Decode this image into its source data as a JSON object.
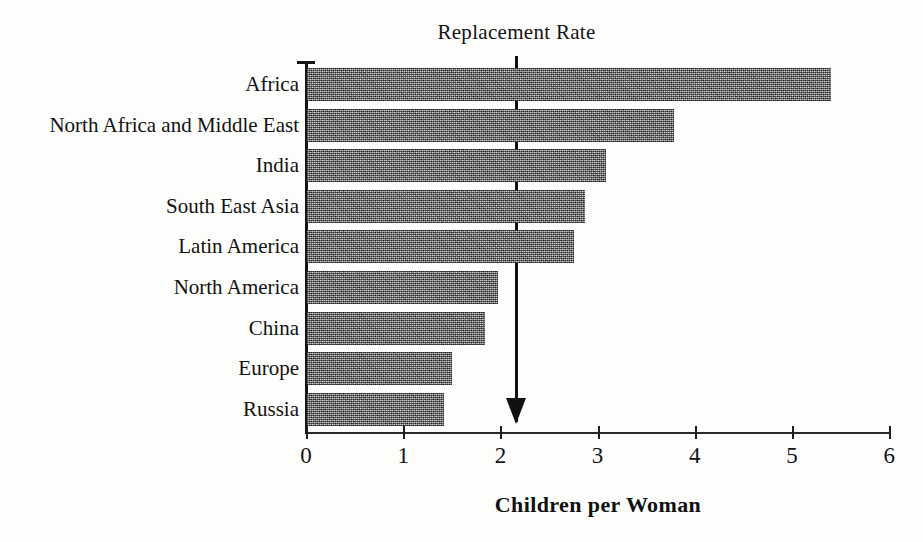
{
  "chart_data": {
    "type": "bar",
    "orientation": "horizontal",
    "title": "",
    "xlabel": "Children per Woman",
    "ylabel": "",
    "xlim": [
      0,
      6
    ],
    "xticks": [
      0,
      1,
      2,
      3,
      4,
      5,
      6
    ],
    "xtick_labels": [
      "0",
      "1",
      "2",
      "3",
      "4",
      "5",
      "6"
    ],
    "grid": false,
    "legend": null,
    "categories": [
      "Africa",
      "North Africa and Middle East",
      "India",
      "South East Asia",
      "Latin America",
      "North America",
      "China",
      "Europe",
      "Russia"
    ],
    "values": [
      5.39,
      3.78,
      3.08,
      2.86,
      2.75,
      1.96,
      1.83,
      1.49,
      1.41
    ],
    "bar_color": "#6f6f6f",
    "annotations": [
      {
        "text": "Replacement Rate",
        "type": "arrow",
        "x_value": 2.15,
        "points_to": "x-axis"
      }
    ]
  }
}
